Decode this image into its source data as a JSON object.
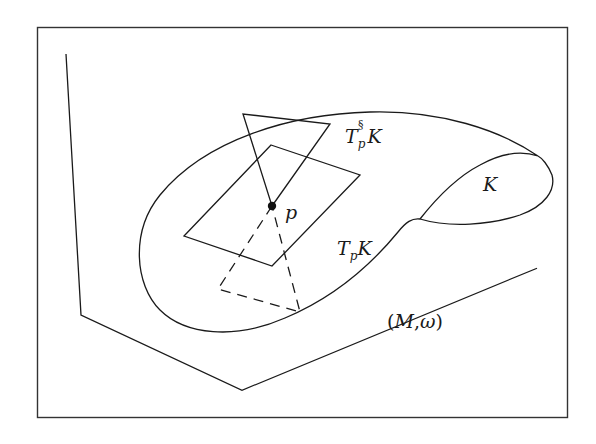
{
  "figure": {
    "type": "symplectic-geometry-diagram",
    "labels": {
      "tangent_symplectic_complement": {
        "base": "T",
        "sub": "p",
        "sup": "§",
        "tail": "K"
      },
      "submanifold": "K",
      "point": "p",
      "tangent_space": {
        "base": "T",
        "sub": "p",
        "tail": "K"
      },
      "ambient_manifold": {
        "open": "(",
        "M": "M",
        "comma": ",",
        "omega": "ω",
        "close": ")"
      }
    },
    "colors": {
      "ink": "#1a1a1a",
      "frame": "#333333",
      "background": "#ffffff"
    }
  }
}
